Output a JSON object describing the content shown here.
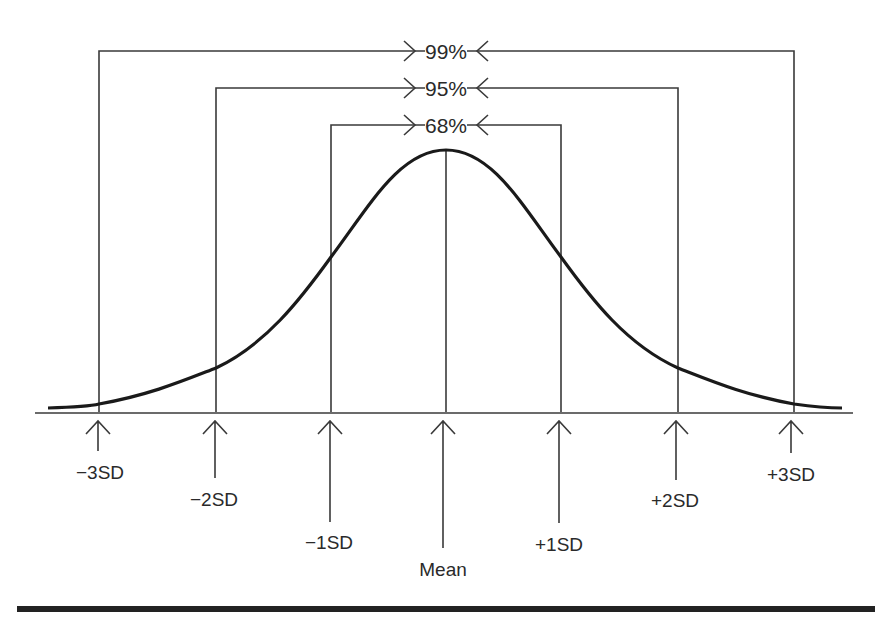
{
  "diagram": {
    "type": "normal-distribution",
    "intervals": [
      {
        "label": "99%",
        "range": "±3SD"
      },
      {
        "label": "95%",
        "range": "±2SD"
      },
      {
        "label": "68%",
        "range": "±1SD"
      }
    ],
    "axis_labels": {
      "m3": "−3SD",
      "m2": "−2SD",
      "m1": "−1SD",
      "mean": "Mean",
      "p1": "+1SD",
      "p2": "+2SD",
      "p3": "+3SD"
    },
    "colors": {
      "line": "#2a2a2a",
      "curve": "#1a1a1a",
      "rule": "#222222"
    }
  }
}
